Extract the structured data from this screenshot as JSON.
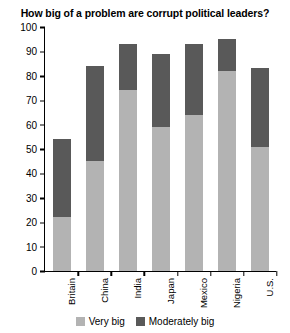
{
  "chart_data": {
    "type": "bar",
    "subtype": "stacked-column",
    "title": "How big of a problem are corrupt political leaders?",
    "xlabel": "",
    "ylabel": "",
    "ylim": [
      0,
      100
    ],
    "yticks": [
      0,
      10,
      20,
      30,
      40,
      50,
      60,
      70,
      80,
      90,
      100
    ],
    "grid": false,
    "legend_position": "bottom-center",
    "categories": [
      "Britain",
      "China",
      "India",
      "Japan",
      "Mexico",
      "Nigeria",
      "U.S."
    ],
    "series": [
      {
        "name": "Very big",
        "color": "#b3b3b3",
        "values": [
          22,
          45,
          74,
          59,
          64,
          82,
          51
        ]
      },
      {
        "name": "Moderately big",
        "color": "#595959",
        "values": [
          32,
          39,
          19,
          30,
          29,
          13,
          32
        ]
      }
    ],
    "totals": [
      54,
      84,
      93,
      89,
      93,
      95,
      83
    ]
  },
  "legend": {
    "items": [
      {
        "label": "Very big",
        "color": "#b3b3b3",
        "swatch_name": "legend-swatch-very-big"
      },
      {
        "label": "Moderately big",
        "color": "#595959",
        "swatch_name": "legend-swatch-moderately-big"
      }
    ]
  }
}
